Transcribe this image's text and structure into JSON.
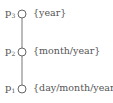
{
  "diagram": {
    "type": "hierarchy-chain",
    "colors": {
      "line": "#777777",
      "node_stroke": "#666666",
      "text": "#555555"
    },
    "nodes": [
      {
        "id": "p3",
        "label_base": "p",
        "label_sub": "3",
        "text": "{year}",
        "cy": 14
      },
      {
        "id": "p2",
        "label_base": "p",
        "label_sub": "2",
        "text": "{month/year}",
        "cy": 52
      },
      {
        "id": "p1",
        "label_base": "p",
        "label_sub": "1",
        "text": "{day/month/year}",
        "cy": 89
      }
    ],
    "edges": [
      {
        "from": "p3",
        "to": "p2"
      },
      {
        "from": "p2",
        "to": "p1"
      }
    ]
  }
}
